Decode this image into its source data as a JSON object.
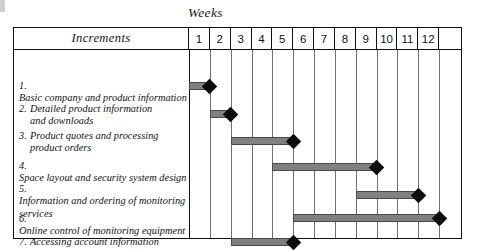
{
  "chart_data": {
    "type": "bar",
    "subtype": "gantt",
    "title": "Weeks",
    "xlabel": "Weeks",
    "ylabel": "Increments",
    "grid": true,
    "legend": false,
    "axis_header": "Increments",
    "week_columns": [
      "1",
      "2",
      "3",
      "4",
      "5",
      "6",
      "7",
      "8",
      "9",
      "10",
      "11",
      "12",
      ""
    ],
    "xlim": [
      1,
      13
    ],
    "colors": {
      "bar_fill": "#808080",
      "bar_outline": "#4a4a4a",
      "milestone": "#0d0d0d",
      "border": "#111111",
      "gridline": "#6f6f6f"
    },
    "categories": [
      "1. Basic company and product information",
      "2. Detailed product information and downloads",
      "3. Product quotes and processing product orders",
      "4. Space layout and security system design",
      "5. Information and ordering of monitoring services",
      "6. Online control of monitoring equipment",
      "7. Accessing account information"
    ],
    "tasks": [
      {
        "number": "1.",
        "lines": [
          "Basic company and product information"
        ],
        "start_week": 1,
        "end_week": 2,
        "milestone_week": 2,
        "duration_weeks": 1
      },
      {
        "number": "2.",
        "lines": [
          "Detailed product information",
          "and downloads"
        ],
        "start_week": 2,
        "end_week": 3,
        "milestone_week": 3,
        "duration_weeks": 1
      },
      {
        "number": "3.",
        "lines": [
          "Product quotes and processing",
          "product orders"
        ],
        "start_week": 3,
        "end_week": 6,
        "milestone_week": 6,
        "duration_weeks": 3
      },
      {
        "number": "4.",
        "lines": [
          "Space layout and security system design"
        ],
        "start_week": 5,
        "end_week": 10,
        "milestone_week": 10,
        "duration_weeks": 5
      },
      {
        "number": "5.",
        "lines": [
          "Information and ordering of monitoring",
          "services"
        ],
        "start_week": 9,
        "end_week": 12,
        "milestone_week": 12,
        "duration_weeks": 3
      },
      {
        "number": "6.",
        "lines": [
          "Online control of monitoring equipment"
        ],
        "start_week": 6,
        "end_week": 13,
        "milestone_week": 13,
        "duration_weeks": 7
      },
      {
        "number": "7.",
        "lines": [
          "Accessing account information"
        ],
        "start_week": 3,
        "end_week": 6,
        "milestone_week": 6,
        "duration_weeks": 3
      }
    ]
  }
}
